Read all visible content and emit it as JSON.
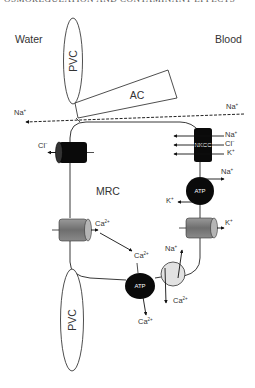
{
  "header": {
    "partial_title": "OSMOREGULATION AND CONTAMINANT EFFECTS"
  },
  "regions": {
    "left": "Water",
    "right": "Blood"
  },
  "cell": {
    "label": "MRC"
  },
  "structures": {
    "pvc_top": "PVC",
    "pvc_bottom": "PVC",
    "accessory_cell": "AC",
    "nkcc": "NKCC",
    "atp_right": "ATP",
    "atp_bottom": "ATP"
  },
  "ions": {
    "na_paracellular_in": {
      "base": "Na",
      "sup": "+"
    },
    "na_paracellular_out": {
      "base": "Na",
      "sup": "+"
    },
    "cl_channel": {
      "base": "Cl",
      "sup": "−"
    },
    "nkcc_na": {
      "base": "Na",
      "sup": "+"
    },
    "nkcc_cl": {
      "base": "Cl",
      "sup": "−"
    },
    "nkcc_k": {
      "base": "K",
      "sup": "+"
    },
    "atp_right_na": {
      "base": "Na",
      "sup": "+"
    },
    "atp_right_k": {
      "base": "K",
      "sup": "+"
    },
    "k_channel": {
      "base": "K",
      "sup": "+"
    },
    "ca_channel": {
      "base": "Ca",
      "sup": "2+"
    },
    "ca_cytosol": {
      "base": "Ca",
      "sup": "2+"
    },
    "exchanger_na": {
      "base": "Na",
      "sup": "+"
    },
    "exchanger_ca": {
      "base": "Ca",
      "sup": "2+"
    },
    "atp_bottom_ca": {
      "base": "Ca",
      "sup": "2+"
    }
  },
  "colors": {
    "line": "#222222",
    "black_transporter": "#0a0a0a",
    "grey_channel": "#7a7a7a",
    "exchanger_fill": "#e2e2e2"
  }
}
